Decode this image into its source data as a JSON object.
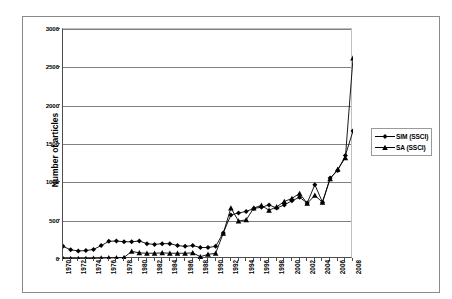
{
  "chart_data": {
    "type": "line",
    "title": "",
    "xlabel": "",
    "ylabel": "Number of articles",
    "ylim": [
      0,
      3000
    ],
    "xlim": [
      1970,
      2008
    ],
    "grid": true,
    "legend_position": "right",
    "y_ticks": [
      0,
      500,
      1000,
      1500,
      2000,
      2500,
      3000
    ],
    "x_tick_labels": [
      "1970",
      "1972",
      "1974",
      "1976",
      "1978",
      "1980",
      "1982",
      "1984",
      "1986",
      "1988",
      "1990",
      "1992",
      "1994",
      "1996",
      "1998",
      "2000",
      "2002",
      "2004",
      "2006",
      "2008"
    ],
    "x": [
      1970,
      1971,
      1972,
      1973,
      1974,
      1975,
      1976,
      1977,
      1978,
      1979,
      1980,
      1981,
      1982,
      1983,
      1984,
      1985,
      1986,
      1987,
      1988,
      1989,
      1990,
      1991,
      1992,
      1993,
      1994,
      1995,
      1996,
      1997,
      1998,
      1999,
      2000,
      2001,
      2002,
      2003,
      2004,
      2005,
      2006,
      2007,
      2008
    ],
    "series": [
      {
        "name": "SIM (SSCI)",
        "marker": "diamond",
        "color": "#000000",
        "values": [
          165,
          120,
          105,
          110,
          125,
          175,
          230,
          235,
          225,
          225,
          235,
          200,
          190,
          200,
          200,
          175,
          165,
          175,
          150,
          150,
          165,
          340,
          575,
          600,
          620,
          660,
          675,
          705,
          665,
          705,
          760,
          805,
          730,
          970,
          740,
          1055,
          1155,
          1350,
          1670
        ]
      },
      {
        "name": "SA (SSCI)",
        "marker": "triangle",
        "color": "#000000",
        "values": [
          5,
          5,
          5,
          5,
          8,
          12,
          15,
          15,
          20,
          100,
          80,
          75,
          75,
          80,
          75,
          75,
          75,
          80,
          30,
          60,
          75,
          335,
          665,
          495,
          510,
          665,
          700,
          635,
          680,
          750,
          790,
          855,
          725,
          830,
          740,
          1045,
          1170,
          1320,
          2620
        ]
      }
    ]
  },
  "legend": {
    "items": [
      {
        "label": "SIM (SSCI)",
        "marker": "diamond"
      },
      {
        "label": "SA (SSCI)",
        "marker": "triangle"
      }
    ]
  },
  "axes": {
    "y_title": "Number of articles"
  }
}
